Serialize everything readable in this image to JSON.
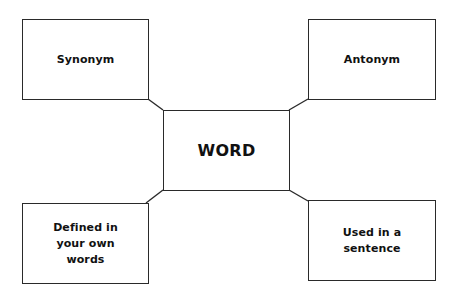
{
  "diagram": {
    "type": "word-map / frayer-style concept map",
    "center": {
      "label": "WORD"
    },
    "nodes": [
      {
        "id": "synonym",
        "label": "Synonym",
        "position": "top-left"
      },
      {
        "id": "antonym",
        "label": "Antonym",
        "position": "top-right"
      },
      {
        "id": "defined",
        "label": "Defined in your own words",
        "position": "bottom-left"
      },
      {
        "id": "sentence",
        "label": "Used in a sentence",
        "position": "bottom-right"
      }
    ],
    "edges": [
      {
        "from": "WORD",
        "to": "synonym"
      },
      {
        "from": "WORD",
        "to": "antonym"
      },
      {
        "from": "WORD",
        "to": "defined"
      },
      {
        "from": "WORD",
        "to": "sentence"
      }
    ],
    "colors": {
      "stroke": "#2a2a2a",
      "text": "#111111",
      "background": "#ffffff"
    }
  }
}
